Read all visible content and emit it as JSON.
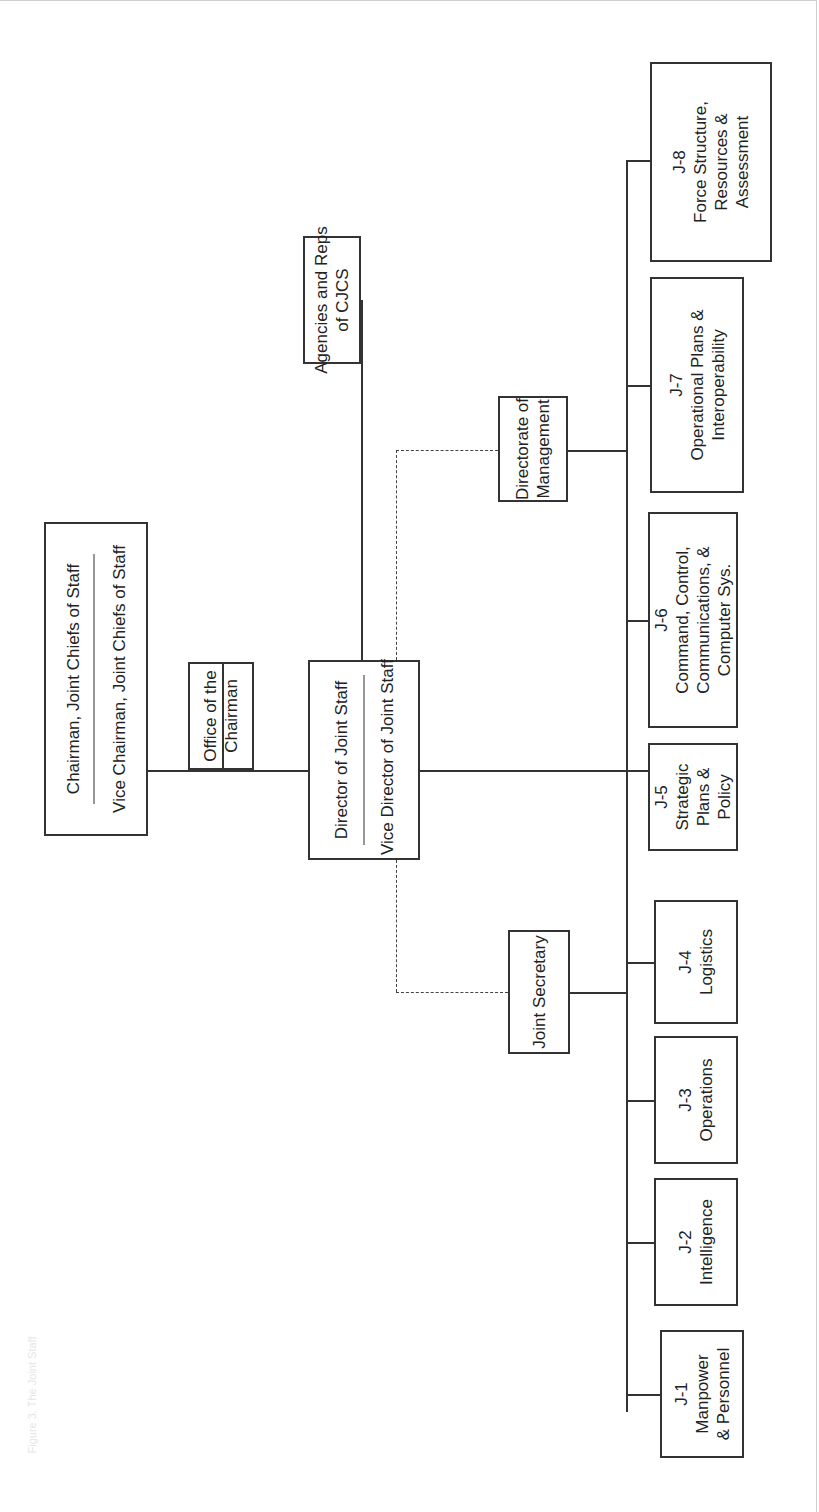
{
  "diagram": {
    "type": "org-chart",
    "orientation": "rotated-90-ccw",
    "caption": "Figure 3. The Joint Staff",
    "nodes": {
      "chairman": {
        "line1": "Chairman, Joint Chiefs of Staff",
        "line2": "Vice Chairman, Joint Chiefs of Staff"
      },
      "office_chairman": {
        "line1": "Office of the",
        "line2": "Chairman"
      },
      "director": {
        "line1": "Director of Joint Staff",
        "line2": "Vice Director of Joint Staff"
      },
      "agencies": {
        "line1": "Agencies and Reps",
        "line2": "of CJCS"
      },
      "directorate_mgmt": {
        "line1": "Directorate of",
        "line2": "Management"
      },
      "joint_secretary": {
        "line1": "Joint Secretary"
      },
      "directorates": [
        {
          "code": "J-1",
          "l1": "Manpower",
          "l2": "& Personnel"
        },
        {
          "code": "J-2",
          "l1": "Intelligence",
          "l2": ""
        },
        {
          "code": "J-3",
          "l1": "Operations",
          "l2": ""
        },
        {
          "code": "J-4",
          "l1": "Logistics",
          "l2": ""
        },
        {
          "code": "J-5",
          "l1": "Strategic",
          "l2": "Plans &",
          "l3": "Policy"
        },
        {
          "code": "J-6",
          "l1": "Command, Control,",
          "l2": "Communications, &",
          "l3": "Computer Sys."
        },
        {
          "code": "J-7",
          "l1": "Operational Plans &",
          "l2": "Interoperability"
        },
        {
          "code": "J-8",
          "l1": "Force Structure,",
          "l2": "Resources &",
          "l3": "Assessment"
        }
      ]
    },
    "edges": [
      {
        "from": "chairman",
        "to": "director",
        "style": "solid"
      },
      {
        "from": "chairman-director-line",
        "to": "office_chairman",
        "style": "solid"
      },
      {
        "from": "director",
        "to": "agencies",
        "style": "solid"
      },
      {
        "from": "director",
        "to": "directorate_mgmt",
        "style": "dashed"
      },
      {
        "from": "director",
        "to": "joint_secretary",
        "style": "dashed"
      },
      {
        "from": "director",
        "to": "J-5",
        "style": "solid"
      },
      {
        "from": "bus",
        "to": "J-1..J-8",
        "style": "solid"
      },
      {
        "from": "joint_secretary",
        "to": "bus",
        "style": "solid"
      },
      {
        "from": "directorate_mgmt",
        "to": "bus",
        "style": "solid"
      }
    ]
  }
}
